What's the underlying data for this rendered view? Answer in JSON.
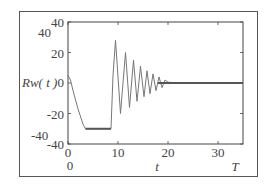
{
  "chart_data": {
    "type": "line",
    "title": "",
    "xlabel": "t",
    "ylabel": "Rw( t )",
    "x_end_label": "T",
    "xlim": [
      0,
      35
    ],
    "ylim": [
      -40,
      40
    ],
    "x_ticks": [
      0,
      10,
      20,
      30
    ],
    "y_ticks": [
      40,
      20,
      0,
      -20,
      -40
    ],
    "extra_labels": {
      "y_outer_top": "40",
      "y_outer_bottom": "-40",
      "x_outer_origin": "0"
    },
    "grid": false,
    "legend": null,
    "series": [
      {
        "name": "Rw(t)",
        "x": [
          0,
          0.5,
          1,
          2,
          3,
          3.5,
          4,
          6,
          8,
          8.6,
          9.0,
          9.5,
          10.5,
          11.5,
          12.3,
          13.1,
          13.8,
          14.5,
          15.2,
          15.8,
          16.4,
          17.0,
          17.6,
          18.2,
          18.8,
          19.4,
          20,
          22,
          25,
          30,
          35
        ],
        "values": [
          5,
          2,
          -5,
          -17,
          -27,
          -30,
          -30,
          -30,
          -30,
          -30,
          5,
          28,
          -20,
          20,
          -16,
          15,
          -12,
          11,
          -9,
          8,
          -7,
          6,
          -5,
          4,
          -3,
          2,
          0.5,
          0,
          0,
          0,
          0
        ]
      }
    ]
  },
  "labels": {
    "y_tick_40": "40",
    "y_tick_20": "20",
    "y_tick_0": "0",
    "y_tick_m20": "-20",
    "y_tick_m40": "-40",
    "x_tick_0": "0",
    "x_tick_10": "10",
    "x_tick_20": "20",
    "x_tick_30": "30",
    "outer_40": "40",
    "outer_m40": "-40",
    "outer_0": "0",
    "ylabel": "Rw( t )",
    "xlabel": "t",
    "x_end": "T"
  }
}
